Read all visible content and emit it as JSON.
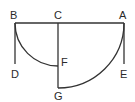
{
  "diagram": {
    "labels": {
      "A": "A",
      "B": "B",
      "C": "C",
      "D": "D",
      "E": "E",
      "F": "F",
      "G": "G"
    },
    "colors": {
      "stroke": "#333333",
      "text": "#2a2a2a",
      "background": "#ffffff"
    }
  }
}
